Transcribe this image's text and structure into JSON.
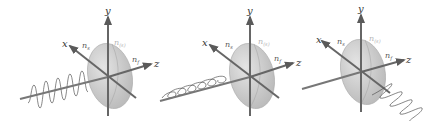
{
  "figure": {
    "panels": [
      {
        "id": "panel-1",
        "axis_labels": {
          "x": "x",
          "y": "y",
          "z": "z"
        },
        "index_labels": {
          "ns": "n",
          "ns_sub": "s",
          "nsf": "n",
          "nsf_sub": "(s)",
          "nf": "n",
          "nf_sub": "f"
        },
        "wave": "vertical-polarized sinusoid along incoming axis"
      },
      {
        "id": "panel-2",
        "axis_labels": {
          "x": "x",
          "y": "y",
          "z": "z"
        },
        "index_labels": {
          "ns": "n",
          "ns_sub": "s",
          "nsf": "n",
          "nsf_sub": "(s)",
          "nf": "n",
          "nf_sub": "f"
        },
        "wave": "horizontal-polarized sinusoid along incoming axis"
      },
      {
        "id": "panel-3",
        "axis_labels": {
          "x": "x",
          "y": "y",
          "z": "z"
        },
        "index_labels": {
          "ns": "n",
          "ns_sub": "s",
          "nsf": "n",
          "nsf_sub": "(s)",
          "nf": "n",
          "nf_sub": "f"
        },
        "wave": "zigzag sinusoid along x direction"
      }
    ],
    "colors": {
      "axis": "#6b6b6b",
      "ellipsoid_fill": "#cfcfcf",
      "ellipsoid_stroke": "#a8a8a8",
      "wave": "#555555",
      "label": "#333333",
      "faint_label": "#b5b5b5"
    }
  }
}
